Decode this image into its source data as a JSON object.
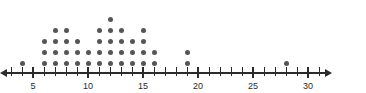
{
  "chart_data": {
    "type": "scatter",
    "plot_style": "dot-plot",
    "title": "",
    "subtitle": "",
    "xlabel": "",
    "ylabel": "",
    "xlim": [
      3,
      31
    ],
    "ylim": [
      0,
      5
    ],
    "grid": false,
    "legend": null,
    "axis": {
      "orientation": "horizontal",
      "tick_step": 1,
      "label_step": 5,
      "arrow_start": true,
      "arrow_end": true,
      "tick_values": [
        3,
        4,
        5,
        6,
        7,
        8,
        9,
        10,
        11,
        12,
        13,
        14,
        15,
        16,
        17,
        18,
        19,
        20,
        21,
        22,
        23,
        24,
        25,
        26,
        27,
        28,
        29,
        30,
        31
      ],
      "tick_labels": [
        {
          "value": 5,
          "text": "5"
        },
        {
          "value": 10,
          "text": "10"
        },
        {
          "value": 15,
          "text": "15"
        },
        {
          "value": 20,
          "text": "20"
        },
        {
          "value": 25,
          "text": "25"
        },
        {
          "value": 30,
          "text": "30"
        }
      ]
    },
    "x": [
      4,
      6,
      7,
      8,
      9,
      10,
      11,
      12,
      13,
      14,
      15,
      16,
      19,
      28
    ],
    "counts": [
      1,
      3,
      4,
      4,
      3,
      2,
      4,
      5,
      4,
      3,
      4,
      2,
      2,
      1
    ],
    "categories": [
      "4",
      "6",
      "7",
      "8",
      "9",
      "10",
      "11",
      "12",
      "13",
      "14",
      "15",
      "16",
      "19",
      "28"
    ],
    "values": [
      1,
      3,
      4,
      4,
      3,
      2,
      4,
      5,
      4,
      3,
      4,
      2,
      2,
      1
    ],
    "total_dots": 42,
    "annotations": []
  },
  "colors": {
    "dot": "#555555",
    "axis": "#2b2b2b",
    "label": "#2b2b2b",
    "background": "#ffffff"
  },
  "geometry": {
    "axis_y": 72,
    "x_of_value_3": 11,
    "px_per_unit": 11,
    "dot_size": 5,
    "row_height": 11,
    "first_row_y": 61
  }
}
